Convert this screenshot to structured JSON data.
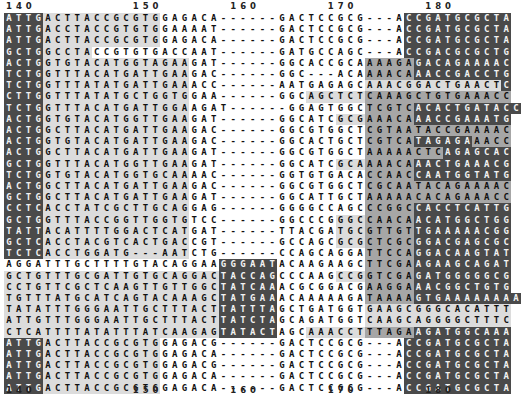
{
  "ruler_top": {
    "labels": [
      {
        "text": "140",
        "col": 0
      },
      {
        "text": "150",
        "col": 13
      },
      {
        "text": "160",
        "col": 23
      },
      {
        "text": "170",
        "col": 33
      },
      {
        "text": "180",
        "col": 43
      }
    ]
  },
  "ruler_bottom": {
    "labels": [
      {
        "text": "140",
        "col": 0
      },
      {
        "text": "150",
        "col": 13
      },
      {
        "text": "160",
        "col": 23
      },
      {
        "text": "170",
        "col": 33
      },
      {
        "text": "180",
        "col": 43
      }
    ]
  },
  "colors": {
    "none": "#ffffff",
    "light": "#dcdcdc",
    "mid": "#a6a6a6",
    "dark": "#4a4a4a"
  },
  "rows": [
    {
      "seq": "ATTGACTTACCGCGTGGAGACA------GACTCCGCG---ACCGATGCGCTA",
      "shade": "3333111111111111000000000000000000000000033333333333333"
    },
    {
      "seq": "ATTGACCTACCGTGTGGAAAAT------GACTCCGCG---ACCGATGCGCTA",
      "shade": "3333111111111111000000000000000000000000033333333333333"
    },
    {
      "seq": "ATTGACTTACCGCGTGGAGACA------GACTCCGCG---ACCGATGCGCTA",
      "shade": "3333111111111111000000000000000000000000033333333333333"
    },
    {
      "seq": "GCTGGCCTACCGTGTGACCAAT------GATGCCAGC---ACCGACGCGCTG",
      "shade": "3333111110000000000000000000000000000000033333333333333"
    },
    {
      "seq": "ACTGGTGTACATGGTAGAAGAT------GGCACCGCAAAAGAGACAGAAAAC",
      "shade": "3333111111111111111000000000000000000222223333333333333"
    },
    {
      "seq": "TCTGGTTTACATGATTGAAGAC------GGC---ACAAAACAAACCGACCTG",
      "shade": "3333111111111111111000000000000000000222223333333333333"
    },
    {
      "seq": "TCTGGTTTATATGATTGAAACC------AATGAGAGCAAACGGACTGAACTC",
      "shade": "3333111111111111111000000000000000000111111111111113333"
    },
    {
      "seq": "CTTGGTTTATATGCTGGTGGAA------GGCAGCTCTCAAAGCTGTGAAACC",
      "shade": "3333111111111111111000000000000111111222222222222222222"
    },
    {
      "seq": "TCTGGTTTACATGATTGGAAGAT------GGAGTGGCTCGTCACACTGATACC",
      "shade": "3333111111111111111000000000000000000222223333333333333"
    },
    {
      "seq": "ACTGGTGTACATGGTTGAAGAT------GGCATCGCGAAACAAACCGAAATG",
      "shade": "3333111111111111111000000000000000111222223333333333333"
    },
    {
      "seq": "ACTGGCTTACATGATTGAAGAC------GGCGTGGCTCGTAATACCGAAAAC",
      "shade": "3333111111111111111000000000000000000222222222222222222"
    },
    {
      "seq": "ACTGGTGTACATGATTGAAGAC------GGCACTGCTCGTCATAGAGAAACC",
      "shade": "3333111111111111111000000000000000000222223333332222222"
    },
    {
      "seq": "ACTGGCTTACATGATTGAAGAT------GGCGTGGCTAAAAACTCAGAGCAC",
      "shade": "3333111111111111111000000000000000000222222223333333333"
    },
    {
      "seq": "GCTGGTTTACATGGTTGAAGAT------GGCATCGCAAAACAAACTGAAACG",
      "shade": "3333111111111111111000000000000000111222223333333333333"
    },
    {
      "seq": "TCTGGTGTACATGGTGCAAAAC------GGTGTGACACCAACCAATGGTATG",
      "shade": "3333111111111111111000000000000000000222223333333333333"
    },
    {
      "seq": "ACTGGCTTACATGATTGAAGAC------GGCGTGGCTCGCAATACAGAAAAC",
      "shade": "3333111111111111111000000000000000000222222222222222222"
    },
    {
      "seq": "GCTGGCTTACATGATTGAAGAT------GGCATTGCTAAAAACACAGAAACC",
      "shade": "3333111111111111111000000000000000000222222222222222222"
    },
    {
      "seq": "CCTCACCTATCGCTTGCAGGAG------GGGGCCAGCCCGGCCACCTCATTG",
      "shade": "3333111111111111111000000000000000000222223333333333333"
    },
    {
      "seq": "GCTGGTTTACCGGTTGGTGTCC------GGCCCGGGCCAACAACATGGCTGG",
      "shade": "3333111111111111111000000000000000111222223333333333333"
    },
    {
      "seq": "TATTACATTTTGGACTCATGAT------TTACGATGCGTTGTTGAAAAACGG",
      "shade": "3333111111111111111000000000000000111222223333333333333"
    },
    {
      "seq": "GCTCACCTACGTCACTGACCGT------GCCAGCGCGCTCGCGGACGAGCGC",
      "shade": "3333111111111111111000000000000000111222223333333333333"
    },
    {
      "seq": "TCTCACCTGGATG---AATCTG------CCAGCAGGATTCCAGGACAAGTAT",
      "shade": "3333111111111111111000000000000000000222223333333333333"
    },
    {
      "seq": "AGGATTTGCTTTTGTACAGGAAGGGAATACAAGAAGCTTCGAAGAAGCAGAT",
      "shade": "0000000000000000000000333333000000000222223333333333333"
    },
    {
      "seq": "GCTGTTTGCGATTGTGCAGGACTACCAGCCCAAGCCGGTCGAGATGGGGGCG",
      "shade": "1111111111111111111111333333000000111222223333333333333"
    },
    {
      "seq": "CCTGTTCGCTCAAGTTGTTGGCTATCAAACGCGGACGAAGGAAACGGCTGTG",
      "shade": "1111111111111111111111333333000000000222223333333333333"
    },
    {
      "seq": "TGTTTATGCATCAGTACAAAGCTATGAAACAAAAAGATAAAAGTGAAAAAAAA",
      "shade": "1111111111111111111111333333000000000222223333333333333"
    },
    {
      "seq": "TATATTTGGGAATTGCTTTACTTATTTAGCTGATGGTGAAGCGGGCACATTT",
      "shade": "1111111111111111111111333333000000000111111111111111111"
    },
    {
      "seq": "ATTGTTTGGGAATTGCTTTACTTATCTAGCAGATGGTCAAGCAGGGGCTTTC",
      "shade": "1111111111111111111111333333000000000111111111111111111"
    },
    {
      "seq": "CTCATTTTATATTTATCAAGAGTATACTAGCAAACCTTTAGAAGATGGCAAA",
      "shade": "1111111111111111111111333333000111111222223333333333333"
    },
    {
      "seq": "ATTGACTTACCGCGTGGAGACG------GACTCCGCG---ACCGATGCGCTA",
      "shade": "3333111111111111000000000000000000000000033333333333333"
    },
    {
      "seq": "ATTGACTTACCGCGTGGAGACA------GACTCCGCG---ACCGATGCGCTA",
      "shade": "3333111111111111000000000000000000000000033333333333333"
    },
    {
      "seq": "ATTGACTTACCGCGTGGAGACG------GACTCCGCG---ACCGATGCGCTA",
      "shade": "3333111111111111000000000000000000000000033333333333333"
    },
    {
      "seq": "ATTGACTTACCGCGTGGAGACA------GACTCCGCG---ACCGATGCGCTA",
      "shade": "3333111111111111000000000000000000000000033333333333333"
    },
    {
      "seq": "ATTGACTTACCGCGTGGAGACA------GACTCCGCG---ACCGATGCGCTA",
      "shade": "3333111111111111000000000000000000000000033333333333333"
    }
  ]
}
